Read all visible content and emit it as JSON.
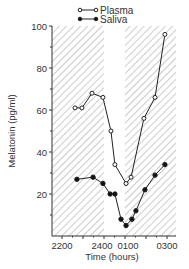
{
  "chart_data": {
    "type": "line",
    "title": "",
    "xlabel": "Time (hours)",
    "ylabel": "Melatonin (pg/ml)",
    "ylim": [
      0,
      100
    ],
    "yticks": [
      20,
      40,
      60,
      80,
      100
    ],
    "xticks": [
      "2200",
      "2400",
      "0100",
      "0300"
    ],
    "xtick_hours": [
      0,
      2,
      3,
      5
    ],
    "x_unit": "hours after 2200",
    "grid": false,
    "legend_position": "top",
    "shaded_regions": [
      {
        "from_hours": -0.5,
        "to_hours": 2.0,
        "style": "diagonal-hatch"
      },
      {
        "from_hours": 3.0,
        "to_hours": 5.5,
        "style": "diagonal-hatch"
      }
    ],
    "series": [
      {
        "name": "Plasma",
        "marker": "open-circle",
        "x": [
          0.62,
          0.95,
          1.43,
          1.95,
          2.33,
          2.52,
          3.05,
          3.29,
          3.9,
          4.43,
          4.9
        ],
        "values": [
          61,
          61,
          68,
          66,
          50,
          34,
          25,
          28,
          56,
          66,
          96
        ]
      },
      {
        "name": "Saliva",
        "marker": "filled-circle",
        "x": [
          0.71,
          1.48,
          1.95,
          2.29,
          2.52,
          2.81,
          3.05,
          3.33,
          3.52,
          3.95,
          4.43,
          4.9
        ],
        "values": [
          27,
          28,
          25,
          20,
          20,
          8,
          5,
          8,
          12,
          22,
          29,
          34
        ]
      }
    ]
  },
  "labels": {
    "xlabel": "Time (hours)",
    "ylabel": "Melatonin (pg/ml)",
    "legend": [
      "Plasma",
      "Saliva"
    ],
    "yticks": [
      "20",
      "40",
      "60",
      "80",
      "100"
    ],
    "xticks": [
      "2200",
      "2400",
      "0100",
      "0300"
    ]
  }
}
